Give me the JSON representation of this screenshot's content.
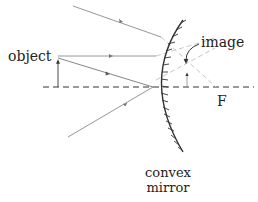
{
  "diagram": {
    "type": "ray-diagram",
    "labels": {
      "object": "object",
      "image": "image",
      "focal_point": "F",
      "mirror_line1": "convex",
      "mirror_line2": "mirror"
    },
    "colors": {
      "ray": "#8a8a8a",
      "ray_extension": "#b5b5b5",
      "axis": "#333333",
      "mirror": "#333333",
      "text": "#222222"
    }
  }
}
